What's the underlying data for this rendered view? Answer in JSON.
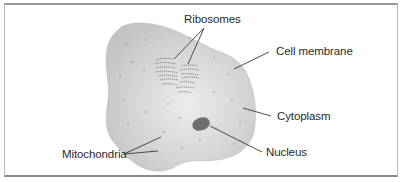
{
  "diagram": {
    "colors": {
      "cytoplasm_fill": "#cfcfcf",
      "cytoplasm_highlight": "#e9e9e9",
      "nucleus_fill": "#6e6e6e",
      "ribosome_stroke": "#7a7a7a",
      "leader_line": "#3a3a3a",
      "text": "#2a2a2a"
    },
    "labels": {
      "ribosomes": "Ribosomes",
      "cell_membrane": "Cell membrane",
      "cytoplasm": "Cytoplasm",
      "nucleus": "Nucleus",
      "mitochondria": "Mitochondria"
    }
  }
}
